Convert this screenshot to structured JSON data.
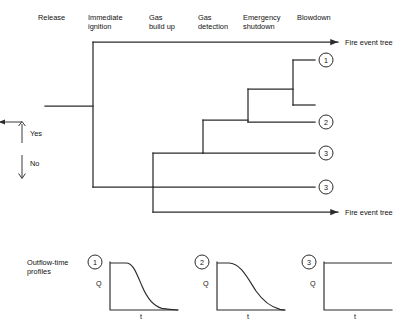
{
  "diagram": {
    "title_right_top": "Fire event tree",
    "title_right_bottom": "Fire event tree",
    "columns": [
      {
        "id": "release",
        "label": "Release"
      },
      {
        "id": "immediate-ignition",
        "label": "Immediate\nignition"
      },
      {
        "id": "gas-build-up",
        "label": "Gas\nbuild up"
      },
      {
        "id": "gas-detection",
        "label": "Gas\ndetection"
      },
      {
        "id": "emergency-shutdown",
        "label": "Emergency\nshutdown"
      },
      {
        "id": "blowdown",
        "label": "Blowdown"
      }
    ],
    "branch_legend": {
      "yes": "Yes",
      "no": "No"
    },
    "outcomes": [
      {
        "id": "outcome-1",
        "label": "1"
      },
      {
        "id": "outcome-2",
        "label": "2"
      },
      {
        "id": "outcome-3a",
        "label": "3"
      },
      {
        "id": "outcome-3b",
        "label": "3"
      }
    ]
  },
  "profiles": {
    "caption": "Outflow-time\nprofiles",
    "items": [
      {
        "id": "profile-1",
        "badge": "1",
        "ylabel": "Q",
        "xlabel": "t",
        "shape": "plateau-then-sigmoid-decay"
      },
      {
        "id": "profile-2",
        "badge": "2",
        "ylabel": "Q",
        "xlabel": "t",
        "shape": "exponential-decay"
      },
      {
        "id": "profile-3",
        "badge": "3",
        "ylabel": "Q",
        "xlabel": "t",
        "shape": "constant"
      }
    ]
  }
}
